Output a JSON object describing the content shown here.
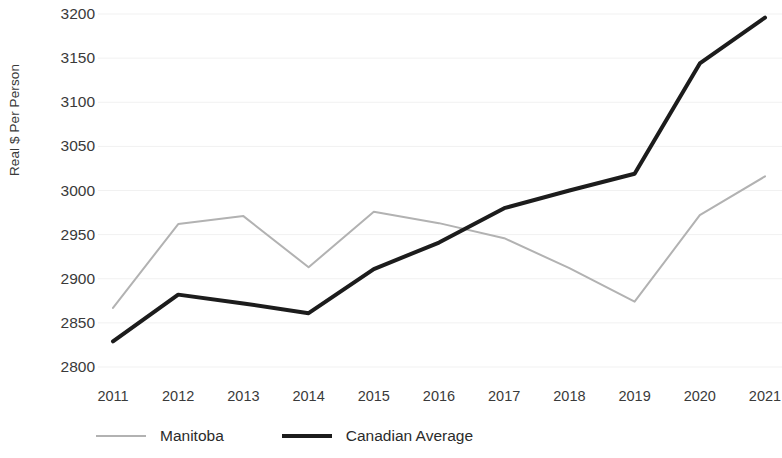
{
  "chart_data": {
    "type": "line",
    "title": "",
    "subtitle": "",
    "xlabel": "",
    "ylabel": "Real $ Per Person",
    "x": [
      2011,
      2012,
      2013,
      2014,
      2015,
      2016,
      2017,
      2018,
      2019,
      2020,
      2021
    ],
    "categories": [
      "2011",
      "2012",
      "2013",
      "2014",
      "2015",
      "2016",
      "2017",
      "2018",
      "2019",
      "2020",
      "2021"
    ],
    "xlim": [
      2011,
      2021
    ],
    "ylim": [
      2800,
      3200
    ],
    "yticks": [
      2800,
      2850,
      2900,
      2950,
      3000,
      3050,
      3100,
      3150,
      3200
    ],
    "ytick_labels": [
      "2800",
      "2850",
      "2900",
      "2950",
      "3000",
      "3050",
      "3100",
      "3150",
      "3200"
    ],
    "grid": true,
    "grid_axis": "y",
    "legend_position": "bottom-left",
    "series": [
      {
        "name": "Manitoba",
        "color": "#b2b2b2",
        "line_width": 2,
        "values": [
          2867,
          2962,
          2971,
          2913,
          2976,
          2963,
          2946,
          2912,
          2874,
          2972,
          3016
        ]
      },
      {
        "name": "Canadian Average",
        "color": "#1c1c1c",
        "line_width": 4,
        "values": [
          2829,
          2882,
          2872,
          2861,
          2911,
          2941,
          2980,
          3000,
          3019,
          3144,
          3196
        ]
      }
    ]
  },
  "legend": {
    "items": [
      {
        "label": "Manitoba",
        "swatch": "manitoba"
      },
      {
        "label": "Canadian Average",
        "swatch": "canada"
      }
    ]
  },
  "colors": {
    "background": "#ffffff",
    "grid": "#f1f1f1",
    "text": "#3a3a3a",
    "manitoba": "#b2b2b2",
    "canadian_average": "#1c1c1c"
  }
}
